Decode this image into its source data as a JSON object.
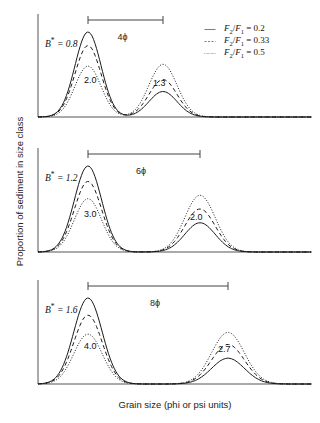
{
  "chart_data": {
    "type": "line",
    "title": "",
    "xlabel": "Grain size (phi or psi units)",
    "ylabel": "Proportion of sediment in size class",
    "grid": false,
    "legend_position": "top-right",
    "legend": [
      {
        "label": "F₂/F₁ = 0.2",
        "style": "solid",
        "ratio": 0.2
      },
      {
        "label": "F₂/F₁ = 0.33",
        "style": "dashed",
        "ratio": 0.33
      },
      {
        "label": "F₂/F₁ = 0.5",
        "style": "dotted",
        "ratio": 0.5
      }
    ],
    "panels": [
      {
        "id": "panel-1",
        "b_star_label": "B",
        "b_star_sup": "*",
        "b_star_value": "= 0.8",
        "mode_spacing": "4ϕ",
        "mode_spacing_phi": 4,
        "peak1_label": "2.0",
        "peak2_label": "1.3",
        "mode1_x": 88,
        "mode2_x": 163,
        "series": [
          {
            "ratio": 0.2,
            "style": "solid",
            "peak1_height": 1.0,
            "peak2_height": 0.3
          },
          {
            "ratio": 0.33,
            "style": "dashed",
            "peak1_height": 0.84,
            "peak2_height": 0.44
          },
          {
            "ratio": 0.5,
            "style": "dotted",
            "peak1_height": 0.6,
            "peak2_height": 0.62
          }
        ]
      },
      {
        "id": "panel-2",
        "b_star_label": "B",
        "b_star_sup": "*",
        "b_star_value": "= 1.2",
        "mode_spacing": "6ϕ",
        "mode_spacing_phi": 6,
        "peak1_label": "3.0",
        "peak2_label": "2.0",
        "mode1_x": 88,
        "mode2_x": 200,
        "series": [
          {
            "ratio": 0.2,
            "style": "solid",
            "peak1_height": 1.0,
            "peak2_height": 0.34
          },
          {
            "ratio": 0.33,
            "style": "dashed",
            "peak1_height": 0.82,
            "peak2_height": 0.5
          },
          {
            "ratio": 0.5,
            "style": "dotted",
            "peak1_height": 0.62,
            "peak2_height": 0.66
          }
        ]
      },
      {
        "id": "panel-3",
        "b_star_label": "B",
        "b_star_sup": "*",
        "b_star_value": "= 1.6",
        "mode_spacing": "8ϕ",
        "mode_spacing_phi": 8,
        "peak1_label": "4.0",
        "peak2_label": "2.7",
        "mode1_x": 88,
        "mode2_x": 228,
        "series": [
          {
            "ratio": 0.2,
            "style": "solid",
            "peak1_height": 1.0,
            "peak2_height": 0.3
          },
          {
            "ratio": 0.33,
            "style": "dashed",
            "peak1_height": 0.8,
            "peak2_height": 0.46
          },
          {
            "ratio": 0.5,
            "style": "dotted",
            "peak1_height": 0.58,
            "peak2_height": 0.6
          }
        ]
      }
    ]
  },
  "axis": {
    "x_title": "Grain size (phi or psi units)",
    "y_title": "Proportion of sediment in size class"
  }
}
